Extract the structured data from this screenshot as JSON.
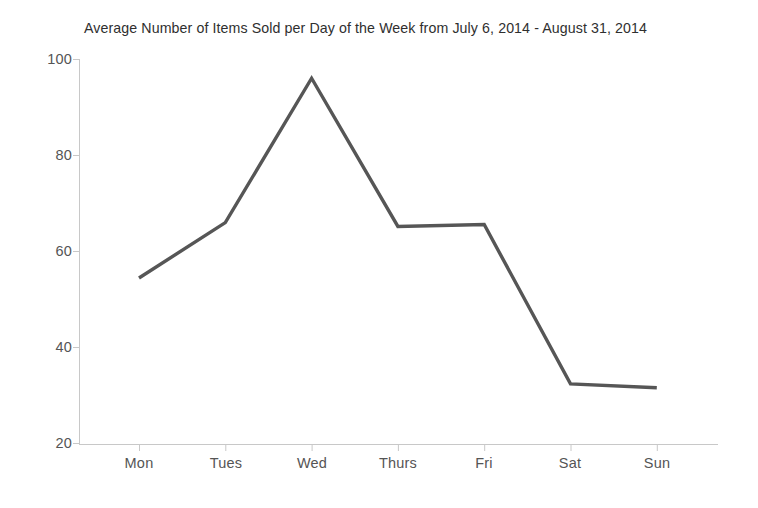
{
  "chart_data": {
    "type": "line",
    "title": "Average Number of Items Sold per Day of the Week from July 6, 2014 - August 31, 2014",
    "xlabel": "",
    "ylabel": "",
    "categories": [
      "Mon",
      "Tues",
      "Wed",
      "Thurs",
      "Fri",
      "Sat",
      "Sun"
    ],
    "values": [
      54.5,
      66,
      96,
      65.2,
      65.6,
      32.5,
      31.7
    ],
    "series": [
      {
        "name": "Average items sold",
        "values": [
          54.5,
          66,
          96,
          65.2,
          65.6,
          32.5,
          31.7
        ]
      }
    ],
    "ylim": [
      20,
      100
    ],
    "y_ticks": [
      100,
      80,
      60,
      40,
      20
    ],
    "y_tick_labels": [
      "100",
      "80",
      "60",
      "40",
      "20"
    ],
    "x_tick_labels": [
      "Mon",
      "Tues",
      "Wed",
      "Thurs",
      "Fri",
      "Sat",
      "Sun"
    ],
    "grid": false,
    "legend": null,
    "legend_position": "none",
    "line_color": "#565656",
    "axis_color": "#c8c8c8",
    "background_color": "#ffffff",
    "markers": false
  },
  "axis": {
    "y_label_100": "100",
    "y_label_80": "80",
    "y_label_60": "60",
    "y_label_40": "40",
    "y_label_20": "20",
    "x_label_mon": "Mon",
    "x_label_tues": "Tues",
    "x_label_wed": "Wed",
    "x_label_thurs": "Thurs",
    "x_label_fri": "Fri",
    "x_label_sat": "Sat",
    "x_label_sun": "Sun"
  }
}
